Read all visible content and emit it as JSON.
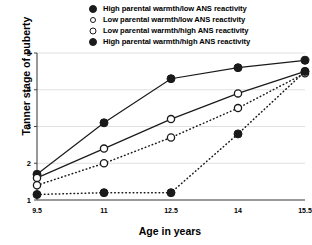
{
  "chart_data": {
    "type": "line",
    "title": "",
    "xlabel": "Age in years",
    "ylabel": "Tanner stage of puberty",
    "x": [
      9.5,
      11,
      12.5,
      14,
      15.5
    ],
    "xtick_labels": [
      "9.5",
      "11",
      "12.5",
      "14",
      "15.5"
    ],
    "ytick_labels": [
      "1",
      "2",
      "3",
      "4",
      "5"
    ],
    "xlim": [
      9.5,
      15.5
    ],
    "ylim": [
      1,
      5
    ],
    "grid": "horizontal",
    "legend_position": "top-right",
    "series": [
      {
        "name": "High parental warmth/low ANS reactivity",
        "marker": "filled-circle",
        "line": "solid",
        "values": [
          1.7,
          3.1,
          4.3,
          4.6,
          4.8
        ]
      },
      {
        "name": "Low parental warmth/low ANS reactivity",
        "marker": "open-circle",
        "line": "solid",
        "values": [
          1.6,
          2.4,
          3.2,
          3.9,
          4.5
        ]
      },
      {
        "name": "Low parental warmth/high ANS reactivity",
        "marker": "open-circle",
        "line": "dotted",
        "values": [
          1.4,
          2.0,
          2.7,
          3.5,
          4.45
        ]
      },
      {
        "name": "High parental warmth/high ANS reactivity",
        "marker": "filled-circle",
        "line": "dotted",
        "values": [
          1.15,
          1.2,
          1.2,
          2.8,
          4.5
        ]
      }
    ],
    "colors": {
      "line": "#1a1a1a",
      "grid": "#d8d8d8",
      "axis": "#444444",
      "marker_fill": "#1a1a1a",
      "marker_open": "#ffffff",
      "background": "#ffffff"
    }
  }
}
